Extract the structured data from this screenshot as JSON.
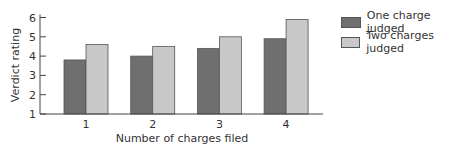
{
  "chart_data": {
    "type": "bar",
    "title": "",
    "xlabel": "Number of charges filed",
    "ylabel": "Verdict rating",
    "categories": [
      "1",
      "2",
      "3",
      "4"
    ],
    "series": [
      {
        "name": "One charge judged",
        "color": "#6f6f6f",
        "values": [
          3.8,
          4.0,
          4.4,
          4.9
        ]
      },
      {
        "name": "Two charges judged",
        "color": "#c8c8c8",
        "values": [
          4.6,
          4.5,
          5.0,
          5.9
        ]
      }
    ],
    "ylim": [
      1,
      6
    ],
    "yticks": [
      1,
      2,
      3,
      4,
      5,
      6
    ],
    "grid": false,
    "legend_position": "right"
  },
  "legend": {
    "items": [
      {
        "label": "One charge judged",
        "color": "#6f6f6f"
      },
      {
        "label": "Two charges judged",
        "color": "#c8c8c8"
      }
    ]
  }
}
